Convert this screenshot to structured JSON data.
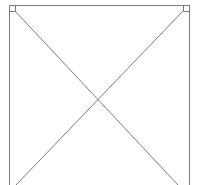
{
  "diagram": {
    "type": "geometric-figure",
    "stroke_color": "#7a7a7a",
    "frame": {
      "left_x": 9,
      "right_x": 189,
      "top_y": 5,
      "bottom_y": 185
    },
    "right_angle_markers": [
      {
        "corner": "top-left",
        "x": 9,
        "y": 5,
        "size": 6
      },
      {
        "corner": "top-right",
        "x": 189,
        "y": 5,
        "size": 6
      }
    ],
    "diagonals": [
      {
        "from": [
          15,
          11
        ],
        "to": [
          178,
          185
        ]
      },
      {
        "from": [
          183,
          11
        ],
        "to": [
          16,
          185
        ]
      }
    ],
    "intersection": [
      99,
      98
    ]
  }
}
